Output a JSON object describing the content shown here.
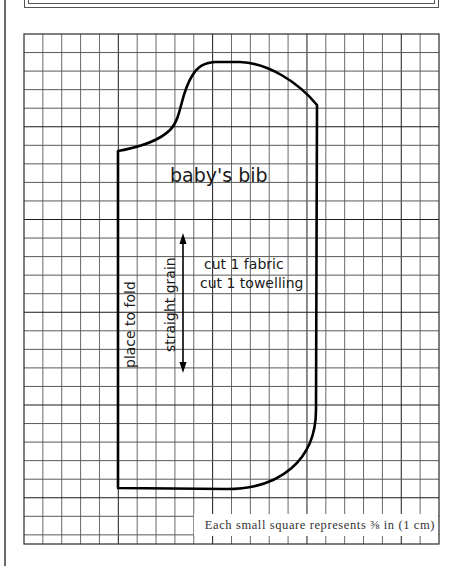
{
  "pattern": {
    "title": "baby's bib",
    "grain_label": "straight grain",
    "fold_label": "place to fold",
    "cutting_instructions": [
      "cut 1 fabric",
      "cut 1 towelling"
    ],
    "scale_legend": "Each small square represents ⅜ in (1 cm)"
  },
  "grid": {
    "columns": 22,
    "rows": 27,
    "line_color": "#2a2a2a",
    "outline_color": "#000000"
  }
}
